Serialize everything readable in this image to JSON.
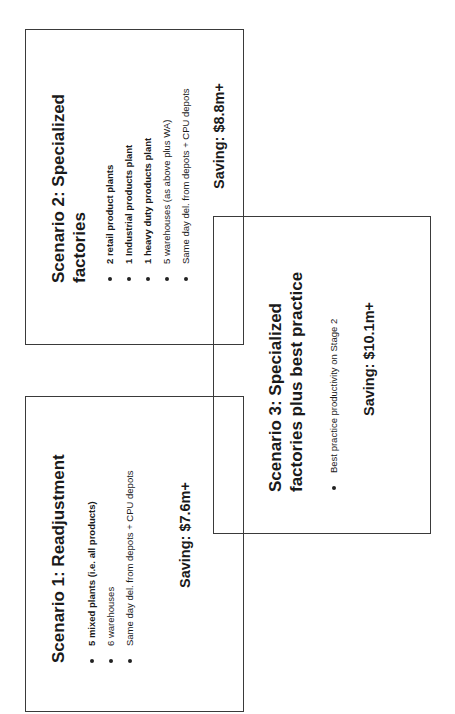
{
  "scenarios": [
    {
      "title_line1": "Scenario 1: Readjustment",
      "bullets": [
        {
          "text": "5 mixed plants (i.e. all products)",
          "bold": true
        },
        {
          "text": "6 warehouses",
          "bold": false
        },
        {
          "text": "Same day del. from depots + CPU depots",
          "bold": false
        }
      ],
      "saving": "Saving: $7.6m+"
    },
    {
      "title_line1": "Scenario 2: Specialized",
      "title_line2": "factories",
      "bullets": [
        {
          "text": "2 retail product plants",
          "bold": true
        },
        {
          "text": "1 Industrial products plant",
          "bold": true
        },
        {
          "text": "1 heavy duty products plant",
          "bold": true
        },
        {
          "text": "5 warehouses (as above plus WA)",
          "bold": false
        },
        {
          "text": "Same day del. from depots + CPU depots",
          "bold": false
        }
      ],
      "saving": "Saving: $8.8m+"
    },
    {
      "title_line1": "Scenario 3: Specialized",
      "title_line2": "factories plus best practice",
      "bullets": [
        {
          "text": "Best practice productivity on Stage 2",
          "bold": false
        }
      ],
      "saving": "Saving: $10.1m+"
    }
  ]
}
